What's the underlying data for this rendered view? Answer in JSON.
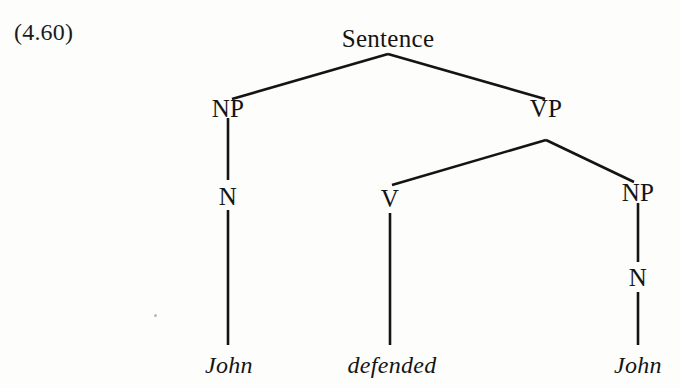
{
  "figure": {
    "example_number": "(4.60)",
    "background_color": "#fdfdfc",
    "ink_color": "#141414",
    "nodes": {
      "root": "Sentence",
      "subject_np": "NP",
      "subject_n": "N",
      "vp": "VP",
      "verb_v": "V",
      "object_np": "NP",
      "object_n": "N"
    },
    "leaves": {
      "subject_word": "John",
      "verb_word": "defended",
      "object_word": "John"
    }
  }
}
